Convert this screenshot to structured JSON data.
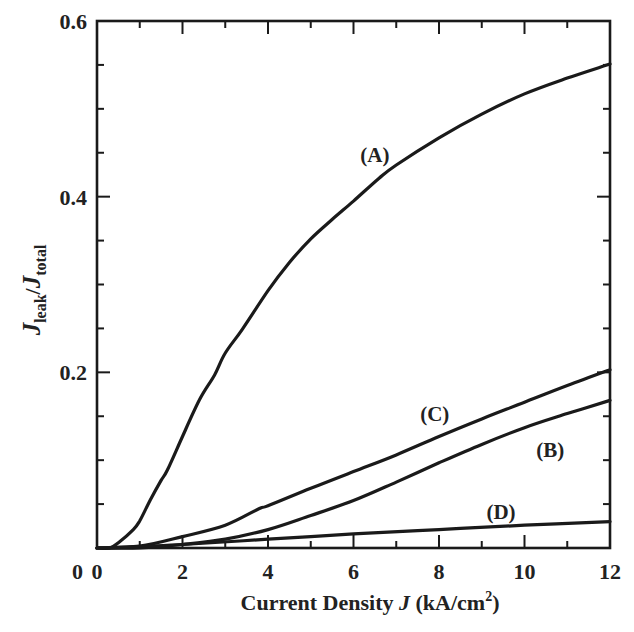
{
  "chart_data": {
    "type": "line",
    "title": "",
    "xlabel": "Current Density J (kA/cm²)",
    "xlabel_parts": {
      "prefix": "Current Density ",
      "var": "J",
      "unit_open": " (kA/cm",
      "sup": "2",
      "unit_close": ")"
    },
    "ylabel": "J_leak/J_total",
    "ylabel_parts": {
      "var1": "J",
      "sub1": "leak",
      "slash": "/",
      "var2": "J",
      "sub2": "total"
    },
    "xlim": [
      0,
      12
    ],
    "ylim": [
      0,
      0.6
    ],
    "x_ticks": [
      0,
      2,
      4,
      6,
      8,
      10,
      12
    ],
    "x_tick_labels": [
      "0",
      "2",
      "4",
      "6",
      "8",
      "10",
      "12"
    ],
    "x_minor_step": 1,
    "y_ticks": [
      0,
      0.2,
      0.4,
      0.6
    ],
    "y_tick_labels": [
      "0",
      "0.2",
      "0.4",
      "0.6"
    ],
    "y_minor_step": 0.05,
    "grid": false,
    "legend": "none (inline curve labels)",
    "series": [
      {
        "name": "(A)",
        "label_pos": {
          "x": 6.5,
          "y": 0.447
        },
        "x": [
          0,
          0.3,
          0.5,
          0.85,
          1.0,
          1.25,
          1.5,
          1.65,
          2.0,
          2.4,
          2.75,
          3.0,
          3.4,
          4.0,
          4.5,
          5.0,
          5.5,
          6.0,
          6.6,
          7.0,
          8.0,
          9.0,
          10.0,
          11.0,
          12.0
        ],
        "y": [
          0,
          0.0,
          0.006,
          0.021,
          0.031,
          0.055,
          0.077,
          0.089,
          0.127,
          0.169,
          0.197,
          0.222,
          0.249,
          0.293,
          0.325,
          0.352,
          0.374,
          0.395,
          0.421,
          0.436,
          0.467,
          0.494,
          0.517,
          0.535,
          0.551
        ]
      },
      {
        "name": "(B)",
        "label_pos": {
          "x": 10.6,
          "y": 0.112
        },
        "x": [
          0,
          1.0,
          2.0,
          3.0,
          4.0,
          5.0,
          6.0,
          7.0,
          8.0,
          9.0,
          10.0,
          11.0,
          12.0
        ],
        "y": [
          0,
          0.0,
          0.004,
          0.01,
          0.021,
          0.037,
          0.054,
          0.075,
          0.097,
          0.118,
          0.137,
          0.153,
          0.168
        ]
      },
      {
        "name": "(C)",
        "label_pos": {
          "x": 7.9,
          "y": 0.152
        },
        "x": [
          0,
          1.0,
          2.0,
          3.0,
          3.8,
          4.0,
          5.0,
          6.0,
          7.0,
          8.0,
          9.0,
          10.0,
          11.0,
          12.0
        ],
        "y": [
          0,
          0.002,
          0.013,
          0.026,
          0.045,
          0.048,
          0.068,
          0.087,
          0.106,
          0.127,
          0.147,
          0.166,
          0.185,
          0.203
        ]
      },
      {
        "name": "(D)",
        "label_pos": {
          "x": 9.45,
          "y": 0.041
        },
        "x": [
          0,
          2.0,
          4.0,
          6.0,
          8.0,
          10.0,
          12.0
        ],
        "y": [
          0,
          0.004,
          0.01,
          0.016,
          0.021,
          0.026,
          0.03
        ]
      }
    ]
  }
}
